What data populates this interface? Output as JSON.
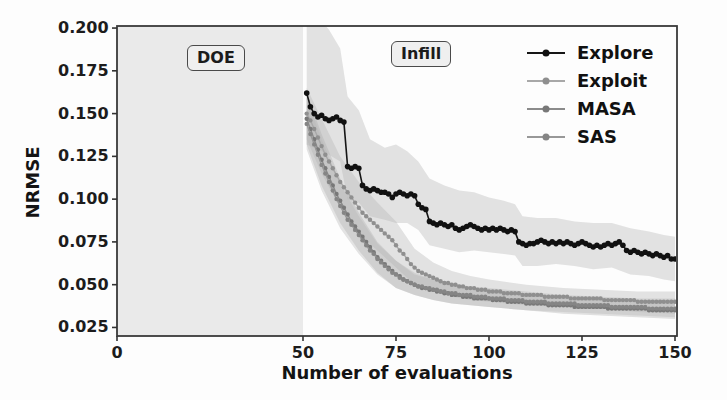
{
  "figure": {
    "xlabel": "Number of evaluations",
    "ylabel": "NRMSE",
    "annotation_doe": "DOE",
    "annotation_infill": "Infill",
    "colors": {
      "background": "#fdfdfd",
      "doe_region_fill": "#eaeaea",
      "spine": "#3a3a3a",
      "tick": "#333333",
      "text": "#1b1b1b"
    }
  },
  "chart_data": {
    "type": "line",
    "title": "",
    "xlabel": "Number of evaluations",
    "ylabel": "NRMSE",
    "xlim": [
      0,
      150
    ],
    "ylim": [
      0.02,
      0.2012
    ],
    "grid": false,
    "legend_position": "upper right",
    "legend_frame": false,
    "x_ticks": [
      "0",
      "50",
      "75",
      "100",
      "125",
      "150"
    ],
    "x_tick_values": [
      0,
      50,
      75,
      100,
      125,
      150
    ],
    "y_ticks": [
      "0.200",
      "0.175",
      "0.150",
      "0.125",
      "0.100",
      "0.075",
      "0.050",
      "0.025"
    ],
    "y_tick_values": [
      0.2,
      0.175,
      0.15,
      0.125,
      0.1,
      0.075,
      0.05,
      0.025
    ],
    "regions": [
      {
        "name": "DOE",
        "x_start": 0,
        "x_end": 50,
        "shaded": true
      },
      {
        "name": "Infill",
        "x_start": 50,
        "x_end": 150,
        "shaded": false
      }
    ],
    "x_start": 51,
    "x_step": 1,
    "series": [
      {
        "name": "Explore",
        "line_color": "#161616",
        "marker_color": "#111111",
        "band_color": "#bdbdbd",
        "band_opacity": 0.42,
        "line_width": 1.6,
        "marker_radius": 2.8,
        "values": [
          0.162,
          0.154,
          0.15,
          0.148,
          0.149,
          0.147,
          0.146,
          0.147,
          0.148,
          0.146,
          0.145,
          0.119,
          0.118,
          0.119,
          0.118,
          0.108,
          0.106,
          0.105,
          0.106,
          0.105,
          0.104,
          0.104,
          0.103,
          0.101,
          0.103,
          0.104,
          0.103,
          0.102,
          0.103,
          0.102,
          0.097,
          0.095,
          0.094,
          0.087,
          0.086,
          0.085,
          0.086,
          0.085,
          0.084,
          0.085,
          0.083,
          0.082,
          0.083,
          0.084,
          0.085,
          0.084,
          0.083,
          0.082,
          0.083,
          0.082,
          0.083,
          0.082,
          0.083,
          0.082,
          0.081,
          0.082,
          0.081,
          0.075,
          0.074,
          0.073,
          0.074,
          0.074,
          0.075,
          0.076,
          0.075,
          0.074,
          0.075,
          0.074,
          0.075,
          0.074,
          0.075,
          0.074,
          0.073,
          0.074,
          0.075,
          0.074,
          0.073,
          0.072,
          0.073,
          0.072,
          0.073,
          0.074,
          0.073,
          0.074,
          0.075,
          0.073,
          0.07,
          0.069,
          0.07,
          0.069,
          0.068,
          0.069,
          0.068,
          0.067,
          0.068,
          0.067,
          0.066,
          0.067,
          0.065,
          0.065
        ],
        "band": [
          [
            51,
            0.132,
            0.207
          ],
          [
            55,
            0.128,
            0.204
          ],
          [
            57,
            0.126,
            0.199
          ],
          [
            60,
            0.122,
            0.188
          ],
          [
            62,
            0.1,
            0.16
          ],
          [
            65,
            0.098,
            0.152
          ],
          [
            68,
            0.09,
            0.135
          ],
          [
            72,
            0.088,
            0.13
          ],
          [
            75,
            0.086,
            0.132
          ],
          [
            78,
            0.086,
            0.128
          ],
          [
            81,
            0.082,
            0.122
          ],
          [
            84,
            0.073,
            0.112
          ],
          [
            88,
            0.071,
            0.108
          ],
          [
            92,
            0.069,
            0.105
          ],
          [
            96,
            0.07,
            0.104
          ],
          [
            100,
            0.069,
            0.101
          ],
          [
            104,
            0.068,
            0.099
          ],
          [
            107,
            0.067,
            0.097
          ],
          [
            109,
            0.061,
            0.09
          ],
          [
            113,
            0.061,
            0.089
          ],
          [
            118,
            0.062,
            0.089
          ],
          [
            123,
            0.061,
            0.087
          ],
          [
            128,
            0.059,
            0.086
          ],
          [
            133,
            0.06,
            0.086
          ],
          [
            138,
            0.056,
            0.083
          ],
          [
            143,
            0.055,
            0.081
          ],
          [
            147,
            0.053,
            0.079
          ],
          [
            150,
            0.052,
            0.078
          ]
        ]
      },
      {
        "name": "Exploit",
        "line_color": "#a8a8a8",
        "marker_color": "#8f8f8f",
        "band_color": "#b5b5b5",
        "band_opacity": 0.38,
        "line_width": 1.4,
        "marker_radius": 2.2,
        "values": [
          0.15,
          0.146,
          0.141,
          0.136,
          0.131,
          0.126,
          0.122,
          0.118,
          0.114,
          0.11,
          0.107,
          0.104,
          0.101,
          0.098,
          0.095,
          0.092,
          0.09,
          0.088,
          0.086,
          0.084,
          0.082,
          0.08,
          0.078,
          0.076,
          0.073,
          0.07,
          0.068,
          0.065,
          0.062,
          0.06,
          0.058,
          0.057,
          0.056,
          0.055,
          0.054,
          0.053,
          0.052,
          0.051,
          0.051,
          0.05,
          0.05,
          0.049,
          0.049,
          0.048,
          0.048,
          0.048,
          0.047,
          0.047,
          0.047,
          0.046,
          0.046,
          0.046,
          0.046,
          0.045,
          0.045,
          0.045,
          0.045,
          0.045,
          0.044,
          0.044,
          0.044,
          0.044,
          0.044,
          0.044,
          0.043,
          0.043,
          0.043,
          0.043,
          0.043,
          0.043,
          0.043,
          0.042,
          0.042,
          0.042,
          0.042,
          0.042,
          0.042,
          0.042,
          0.042,
          0.042,
          0.041,
          0.041,
          0.041,
          0.041,
          0.041,
          0.041,
          0.041,
          0.041,
          0.041,
          0.04,
          0.04,
          0.04,
          0.04,
          0.04,
          0.04,
          0.04,
          0.04,
          0.04,
          0.04,
          0.04
        ],
        "band": [
          [
            51,
            0.135,
            0.165
          ],
          [
            55,
            0.115,
            0.147
          ],
          [
            60,
            0.095,
            0.125
          ],
          [
            65,
            0.08,
            0.11
          ],
          [
            70,
            0.07,
            0.098
          ],
          [
            75,
            0.06,
            0.087
          ],
          [
            80,
            0.05,
            0.071
          ],
          [
            85,
            0.046,
            0.063
          ],
          [
            90,
            0.043,
            0.058
          ],
          [
            95,
            0.041,
            0.055
          ],
          [
            100,
            0.04,
            0.053
          ],
          [
            110,
            0.038,
            0.05
          ],
          [
            120,
            0.037,
            0.048
          ],
          [
            130,
            0.036,
            0.047
          ],
          [
            140,
            0.034,
            0.046
          ],
          [
            150,
            0.033,
            0.046
          ]
        ]
      },
      {
        "name": "MASA",
        "line_color": "#8b8b8b",
        "marker_color": "#787878",
        "band_color": "#b0b0b0",
        "band_opacity": 0.38,
        "line_width": 1.4,
        "marker_radius": 2.2,
        "values": [
          0.147,
          0.141,
          0.135,
          0.129,
          0.123,
          0.118,
          0.113,
          0.108,
          0.103,
          0.099,
          0.095,
          0.091,
          0.087,
          0.084,
          0.081,
          0.078,
          0.075,
          0.072,
          0.069,
          0.066,
          0.064,
          0.062,
          0.06,
          0.058,
          0.056,
          0.055,
          0.053,
          0.052,
          0.051,
          0.05,
          0.049,
          0.048,
          0.048,
          0.047,
          0.047,
          0.046,
          0.046,
          0.045,
          0.045,
          0.044,
          0.044,
          0.044,
          0.043,
          0.043,
          0.043,
          0.042,
          0.042,
          0.042,
          0.042,
          0.042,
          0.041,
          0.041,
          0.041,
          0.041,
          0.04,
          0.04,
          0.04,
          0.04,
          0.04,
          0.039,
          0.039,
          0.039,
          0.039,
          0.039,
          0.039,
          0.038,
          0.038,
          0.038,
          0.038,
          0.038,
          0.038,
          0.038,
          0.037,
          0.037,
          0.037,
          0.037,
          0.037,
          0.037,
          0.037,
          0.037,
          0.037,
          0.036,
          0.036,
          0.036,
          0.036,
          0.036,
          0.036,
          0.036,
          0.036,
          0.036,
          0.036,
          0.036,
          0.035,
          0.035,
          0.035,
          0.035,
          0.035,
          0.035,
          0.035,
          0.035
        ],
        "band": [
          [
            51,
            0.132,
            0.162
          ],
          [
            55,
            0.108,
            0.138
          ],
          [
            60,
            0.086,
            0.112
          ],
          [
            65,
            0.07,
            0.092
          ],
          [
            70,
            0.057,
            0.075
          ],
          [
            75,
            0.048,
            0.064
          ],
          [
            80,
            0.044,
            0.056
          ],
          [
            85,
            0.041,
            0.053
          ],
          [
            90,
            0.039,
            0.05
          ],
          [
            95,
            0.038,
            0.048
          ],
          [
            100,
            0.037,
            0.047
          ],
          [
            110,
            0.035,
            0.045
          ],
          [
            120,
            0.033,
            0.043
          ],
          [
            130,
            0.032,
            0.042
          ],
          [
            140,
            0.031,
            0.041
          ],
          [
            150,
            0.03,
            0.041
          ]
        ]
      },
      {
        "name": "SAS",
        "line_color": "#989898",
        "marker_color": "#858585",
        "band_color": "#b5b5b5",
        "band_opacity": 0.36,
        "line_width": 1.4,
        "marker_radius": 2.2,
        "values": [
          0.144,
          0.138,
          0.132,
          0.126,
          0.12,
          0.115,
          0.11,
          0.105,
          0.1,
          0.096,
          0.092,
          0.088,
          0.085,
          0.082,
          0.079,
          0.076,
          0.073,
          0.07,
          0.068,
          0.065,
          0.063,
          0.061,
          0.059,
          0.057,
          0.056,
          0.054,
          0.053,
          0.052,
          0.051,
          0.05,
          0.049,
          0.049,
          0.048,
          0.048,
          0.047,
          0.047,
          0.046,
          0.046,
          0.045,
          0.045,
          0.045,
          0.044,
          0.044,
          0.044,
          0.044,
          0.043,
          0.043,
          0.043,
          0.043,
          0.042,
          0.042,
          0.042,
          0.042,
          0.042,
          0.041,
          0.041,
          0.041,
          0.041,
          0.041,
          0.04,
          0.04,
          0.04,
          0.04,
          0.04,
          0.04,
          0.039,
          0.039,
          0.039,
          0.039,
          0.039,
          0.039,
          0.039,
          0.039,
          0.038,
          0.038,
          0.038,
          0.038,
          0.038,
          0.038,
          0.038,
          0.038,
          0.038,
          0.037,
          0.037,
          0.037,
          0.037,
          0.037,
          0.037,
          0.037,
          0.037,
          0.037,
          0.037,
          0.036,
          0.036,
          0.036,
          0.036,
          0.036,
          0.036,
          0.036,
          0.036
        ],
        "band": [
          [
            51,
            0.129,
            0.159
          ],
          [
            55,
            0.105,
            0.135
          ],
          [
            60,
            0.083,
            0.109
          ],
          [
            65,
            0.068,
            0.09
          ],
          [
            70,
            0.056,
            0.074
          ],
          [
            75,
            0.048,
            0.064
          ],
          [
            80,
            0.044,
            0.057
          ],
          [
            85,
            0.041,
            0.053
          ],
          [
            90,
            0.039,
            0.051
          ],
          [
            95,
            0.038,
            0.049
          ],
          [
            100,
            0.037,
            0.048
          ],
          [
            110,
            0.035,
            0.046
          ],
          [
            120,
            0.034,
            0.044
          ],
          [
            130,
            0.033,
            0.043
          ],
          [
            140,
            0.032,
            0.042
          ],
          [
            150,
            0.031,
            0.042
          ]
        ]
      }
    ]
  }
}
